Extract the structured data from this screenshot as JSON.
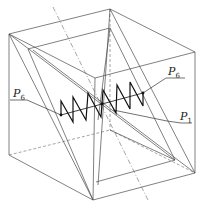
{
  "figure": {
    "labels": {
      "left": {
        "main": "P",
        "sub": "6"
      },
      "upper_right": {
        "main": "P",
        "sub": "6"
      },
      "right": {
        "main": "P",
        "sub": "1"
      }
    },
    "colors": {
      "edge": "#4a4a4a",
      "zigzag": "#111111"
    }
  }
}
